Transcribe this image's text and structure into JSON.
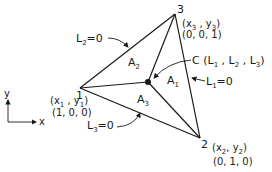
{
  "diagram": {
    "type": "triangle-area-coordinates",
    "vertices": [
      {
        "id": "1",
        "label": "1",
        "coords": "(x1, y1)",
        "natural": "(1, 0, 0)"
      },
      {
        "id": "2",
        "label": "2",
        "coords": "(x2, y2)",
        "natural": "(0, 1, 0)"
      },
      {
        "id": "3",
        "label": "3",
        "coords": "(x3, y3)",
        "natural": "(0, 0, 1)"
      }
    ],
    "point": {
      "label": "C",
      "coords": "(L1, L2, L3)"
    },
    "areas": [
      "A1",
      "A2",
      "A3"
    ],
    "edge_labels": [
      "L1=0",
      "L2=0",
      "L3=0"
    ],
    "axes": {
      "x": "x",
      "y": "y"
    }
  },
  "text": {
    "v1": "1",
    "v2": "2",
    "v3": "3",
    "v1_x": "x",
    "v1_xs": "1",
    "v1_y": "y",
    "v1_ys": "1",
    "v1_nat": "(1, 0, 0)",
    "v2_x": "x",
    "v2_xs": "2",
    "v2_y": "y",
    "v2_ys": "2",
    "v2_nat": "(0, 1, 0)",
    "v3_x": "x",
    "v3_xs": "3",
    "v3_y": "y",
    "v3_ys": "3",
    "v3_nat": "(0, 0, 1)",
    "c": "C",
    "a": "A",
    "a1": "1",
    "a2": "2",
    "a3": "3",
    "l": "L",
    "l1": "1",
    "l2": "2",
    "l3": "3",
    "eq0": "=0",
    "axis_x": "x",
    "axis_y": "y"
  }
}
